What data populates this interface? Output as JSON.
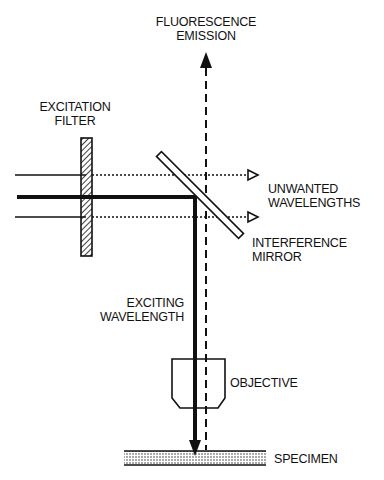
{
  "diagram": {
    "labels": {
      "fluorescence_emission": [
        "FLUORESCENCE",
        "EMISSION"
      ],
      "excitation_filter": [
        "EXCITATION",
        "FILTER"
      ],
      "unwanted_wavelengths": [
        "UNWANTED",
        "WAVELENGTHS"
      ],
      "interference_mirror": [
        "INTERFERENCE",
        "MIRROR"
      ],
      "exciting_wavelength": [
        "EXCITING",
        "WAVELENGTH"
      ],
      "objective": "OBJECTIVE",
      "specimen": "SPECIMEN"
    },
    "colors": {
      "ink": "#111111",
      "background": "#ffffff"
    }
  }
}
